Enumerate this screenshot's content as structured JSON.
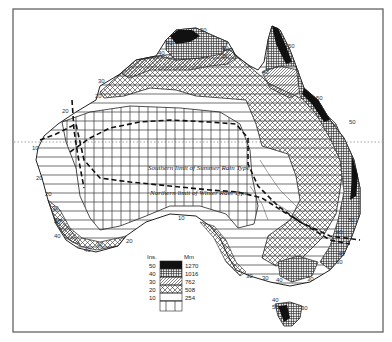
{
  "map": {
    "subject": "Australia annual rainfall zones",
    "lines": {
      "summer_limit": "Southern limit of Summer Rain Type",
      "winter_limit": "Northern limit of Winter Rain Type"
    },
    "contour_labels": [
      {
        "text": "50",
        "x": 200,
        "y": 32
      },
      {
        "text": "40",
        "x": 166,
        "y": 45
      },
      {
        "text": "40",
        "x": 158,
        "y": 55
      },
      {
        "text": "50",
        "x": 222,
        "y": 50
      },
      {
        "text": "50",
        "x": 222,
        "y": 58
      },
      {
        "text": "50",
        "x": 288,
        "y": 48
      },
      {
        "text": "40",
        "x": 262,
        "y": 74
      },
      {
        "text": "30",
        "x": 98,
        "y": 83
      },
      {
        "text": "20",
        "x": 95,
        "y": 98
      },
      {
        "text": "20",
        "x": 62,
        "y": 113
      },
      {
        "text": "50",
        "x": 316,
        "y": 100
      },
      {
        "text": "10",
        "x": 32,
        "y": 150
      },
      {
        "text": "20",
        "x": 36,
        "y": 180
      },
      {
        "text": "20",
        "x": 45,
        "y": 196
      },
      {
        "text": "30",
        "x": 52,
        "y": 210
      },
      {
        "text": "40",
        "x": 54,
        "y": 224
      },
      {
        "text": "40",
        "x": 54,
        "y": 238
      },
      {
        "text": "30",
        "x": 96,
        "y": 246
      },
      {
        "text": "40",
        "x": 84,
        "y": 252
      },
      {
        "text": "20",
        "x": 126,
        "y": 243
      },
      {
        "text": "10",
        "x": 178,
        "y": 220
      },
      {
        "text": "50",
        "x": 349,
        "y": 124
      },
      {
        "text": "50",
        "x": 348,
        "y": 222
      },
      {
        "text": "40",
        "x": 336,
        "y": 234
      },
      {
        "text": "40",
        "x": 338,
        "y": 256
      },
      {
        "text": "30",
        "x": 336,
        "y": 264
      },
      {
        "text": "30",
        "x": 246,
        "y": 278
      },
      {
        "text": "30",
        "x": 262,
        "y": 280
      },
      {
        "text": "40",
        "x": 276,
        "y": 282
      },
      {
        "text": "30",
        "x": 307,
        "y": 281
      },
      {
        "text": "40",
        "x": 272,
        "y": 302
      },
      {
        "text": "50",
        "x": 272,
        "y": 309
      },
      {
        "text": "30",
        "x": 301,
        "y": 310
      }
    ]
  },
  "legend": {
    "header_inches": "Ins.",
    "header_mm": "Mm",
    "rows": [
      {
        "inches": "50",
        "mm": "1270",
        "pattern": "solid-black"
      },
      {
        "inches": "40",
        "mm": "1016",
        "pattern": "fine-crosshatch"
      },
      {
        "inches": "30",
        "mm": "762",
        "pattern": "diagonal-hatch"
      },
      {
        "inches": "20",
        "mm": "508",
        "pattern": "open-crosshatch"
      },
      {
        "inches": "10",
        "mm": "254",
        "pattern": "horizontal-lines"
      },
      {
        "inches": "",
        "mm": "",
        "pattern": "vertical-lines"
      }
    ]
  }
}
